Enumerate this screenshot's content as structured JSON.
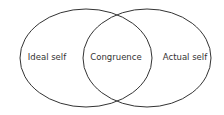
{
  "diagram": {
    "type": "venn",
    "stroke_color": "#333333",
    "circles": [
      {
        "label": "Ideal self"
      },
      {
        "label": "Actual self"
      }
    ],
    "intersection_label": "Congruence"
  }
}
